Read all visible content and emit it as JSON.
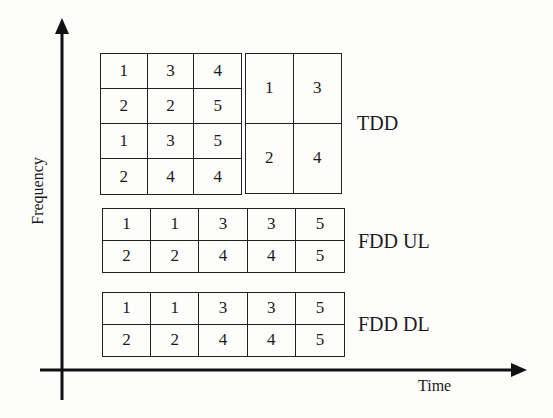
{
  "diagram": {
    "axes": {
      "y_label": "Frequency",
      "x_label": "Time"
    },
    "tdd": {
      "label": "TDD",
      "left_grid": [
        [
          "1",
          "3",
          "4"
        ],
        [
          "2",
          "2",
          "5"
        ],
        [
          "1",
          "3",
          "5"
        ],
        [
          "2",
          "4",
          "4"
        ]
      ],
      "right_grid": [
        [
          "1",
          "3"
        ],
        [
          "2",
          "4"
        ]
      ]
    },
    "fdd_ul": {
      "label": "FDD UL",
      "grid": [
        [
          "1",
          "1",
          "3",
          "3",
          "5"
        ],
        [
          "2",
          "2",
          "4",
          "4",
          "5"
        ]
      ]
    },
    "fdd_dl": {
      "label": "FDD DL",
      "grid": [
        [
          "1",
          "1",
          "3",
          "3",
          "5"
        ],
        [
          "2",
          "2",
          "4",
          "4",
          "5"
        ]
      ]
    }
  }
}
